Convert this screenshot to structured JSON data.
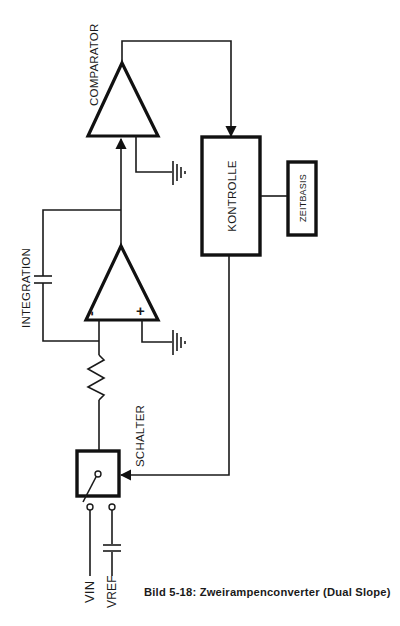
{
  "diagram": {
    "title": "Zweirampenconverter (Dual Slope)",
    "caption": "Bild 5-18: Zweirampenconverter (Dual Slope)",
    "labels": {
      "comparator": "COMPARATOR",
      "integration": "INTEGRATION",
      "control": "KONTROLLE",
      "timebase": "ZEITBASIS",
      "switch": "SCHALTER",
      "vin": "VIN",
      "vref": "VREF",
      "minus": "-",
      "plus": "+"
    },
    "components": [
      {
        "id": "comparator",
        "type": "op-amp",
        "label": "COMPARATOR"
      },
      {
        "id": "integrator",
        "type": "op-amp",
        "label": "INTEGRATION",
        "inputs": [
          "-",
          "+"
        ]
      },
      {
        "id": "integration-capacitor",
        "type": "capacitor"
      },
      {
        "id": "input-resistor",
        "type": "resistor"
      },
      {
        "id": "control",
        "type": "block",
        "label": "KONTROLLE"
      },
      {
        "id": "timebase",
        "type": "block",
        "label": "ZEITBASIS"
      },
      {
        "id": "switch",
        "type": "switch",
        "label": "SCHALTER"
      },
      {
        "id": "vref-capacitor",
        "type": "capacitor"
      },
      {
        "id": "ground-comparator",
        "type": "ground"
      },
      {
        "id": "ground-integrator",
        "type": "ground"
      }
    ],
    "connections": [
      [
        "comparator.output",
        "control.input"
      ],
      [
        "integrator.output",
        "comparator.input"
      ],
      [
        "integrator.output",
        "integration-capacitor"
      ],
      [
        "integration-capacitor",
        "integrator.minus"
      ],
      [
        "comparator.reference",
        "ground-comparator"
      ],
      [
        "integrator.plus",
        "ground-integrator"
      ],
      [
        "control",
        "timebase"
      ],
      [
        "control.output",
        "switch.control"
      ],
      [
        "switch.common",
        "input-resistor"
      ],
      [
        "input-resistor",
        "integrator.minus"
      ],
      [
        "switch.terminal-a",
        "VIN"
      ],
      [
        "switch.terminal-b",
        "vref-capacitor"
      ],
      [
        "vref-capacitor",
        "VREF"
      ]
    ]
  }
}
